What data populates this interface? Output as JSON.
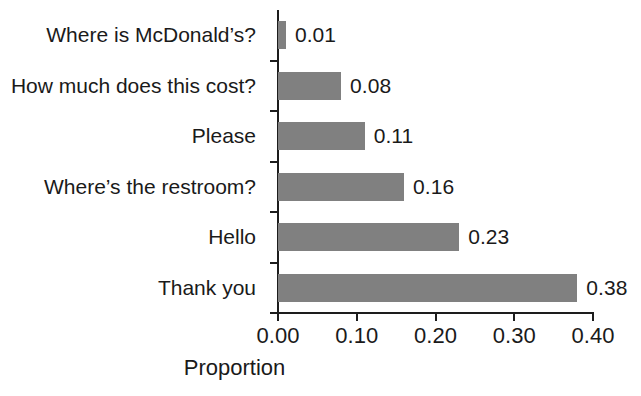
{
  "chart_data": {
    "type": "bar",
    "orientation": "horizontal",
    "title": "",
    "xlabel": "Proportion",
    "ylabel": "",
    "xlim": [
      0.0,
      0.4
    ],
    "xticks": [
      "0.00",
      "0.10",
      "0.20",
      "0.30",
      "0.40"
    ],
    "xtick_values": [
      0.0,
      0.1,
      0.2,
      0.3,
      0.4
    ],
    "grid": false,
    "legend": false,
    "bar_color": "#808080",
    "axis_color": "#1d1d1d",
    "background": "#ffffff",
    "value_labels_shown": true,
    "categories": [
      "Where is McDonald’s?",
      "How much does this cost?",
      "Please",
      "Where’s the restroom?",
      "Hello",
      "Thank you"
    ],
    "values": [
      0.01,
      0.08,
      0.11,
      0.16,
      0.23,
      0.38
    ],
    "value_labels": [
      "0.01",
      "0.08",
      "0.11",
      "0.16",
      "0.23",
      "0.38"
    ]
  }
}
